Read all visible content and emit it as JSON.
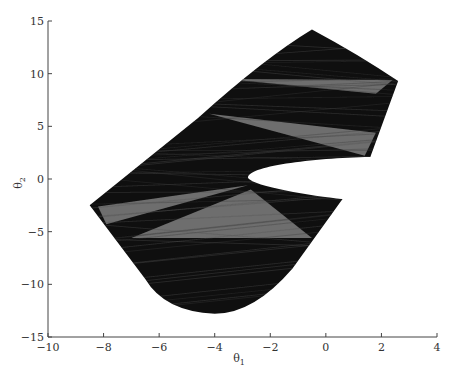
{
  "chart_data": {
    "type": "area",
    "title": "",
    "xlabel": "θ1",
    "ylabel": "θ2",
    "xlim": [
      -10,
      4
    ],
    "ylim": [
      -15,
      15
    ],
    "xticks": [
      -10,
      -8,
      -6,
      -4,
      -2,
      0,
      2,
      4
    ],
    "yticks": [
      -15,
      -10,
      -5,
      0,
      5,
      10,
      15
    ],
    "grid": false,
    "legend": null,
    "outline": [
      {
        "x": -8.5,
        "y": -2.5
      },
      {
        "x": -4.6,
        "y": 5.8
      },
      {
        "x": -0.5,
        "y": 14.2
      },
      {
        "x": 2.6,
        "y": 9.3
      },
      {
        "x": 1.6,
        "y": 2.1
      },
      {
        "x": -2.8,
        "y": 0.1
      },
      {
        "x": 0.6,
        "y": -1.9
      },
      {
        "x": -1.2,
        "y": -8.5
      },
      {
        "x": -4.0,
        "y": -12.8
      },
      {
        "x": -6.5,
        "y": -9.5
      },
      {
        "x": -8.5,
        "y": -2.5
      }
    ],
    "gray_wedges": [
      [
        {
          "x": -3.6,
          "y": 9.5
        },
        {
          "x": 2.4,
          "y": 9.4
        },
        {
          "x": 1.8,
          "y": 8.1
        }
      ],
      [
        {
          "x": -4.2,
          "y": 6.2
        },
        {
          "x": 1.8,
          "y": 4.4
        },
        {
          "x": 1.4,
          "y": 2.2
        }
      ],
      [
        {
          "x": -8.2,
          "y": -2.6
        },
        {
          "x": -2.8,
          "y": -0.6
        },
        {
          "x": -7.9,
          "y": -4.3
        }
      ],
      [
        {
          "x": -7.0,
          "y": -5.6
        },
        {
          "x": -2.7,
          "y": -1.0
        },
        {
          "x": -0.5,
          "y": -5.6
        }
      ]
    ]
  },
  "axes": {
    "x_tick_labels": [
      "−10",
      "−8",
      "−6",
      "−4",
      "−2",
      "0",
      "2",
      "4"
    ],
    "y_tick_labels": [
      "15",
      "10",
      "5",
      "0",
      "−5",
      "−10",
      "−15"
    ],
    "xlabel_main": "θ",
    "xlabel_sub": "1",
    "ylabel_main": "θ",
    "ylabel_sub": "2"
  },
  "colors": {
    "fill_dark": "#111111",
    "fill_gray": "#6e6e6e",
    "axis": "#444444",
    "background": "#ffffff"
  }
}
